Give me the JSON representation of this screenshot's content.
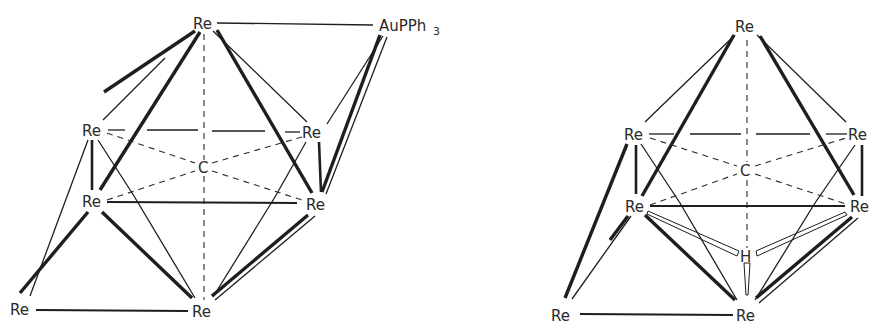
{
  "figure": {
    "left_cluster": {
      "description": "Re8C octahedral cluster with AuPPh3 cap",
      "atoms": [
        {
          "id": "re_top",
          "label": "Re",
          "x": 204,
          "y": 27
        },
        {
          "id": "au",
          "label": "AuPPh",
          "subscript": "3",
          "x": 383,
          "y": 27
        },
        {
          "id": "re_ul",
          "label": "Re",
          "x": 97,
          "y": 133
        },
        {
          "id": "re_ur",
          "label": "Re",
          "x": 313,
          "y": 135
        },
        {
          "id": "c",
          "label": "C",
          "x": 203,
          "y": 168
        },
        {
          "id": "re_ml",
          "label": "Re",
          "x": 93,
          "y": 203
        },
        {
          "id": "re_mr",
          "label": "Re",
          "x": 315,
          "y": 206
        },
        {
          "id": "re_bl",
          "label": "Re",
          "x": 20,
          "y": 311
        },
        {
          "id": "re_b",
          "label": "Re",
          "x": 203,
          "y": 313
        }
      ]
    },
    "right_cluster": {
      "description": "Re8C octahedral cluster with bridging H",
      "atoms": [
        {
          "id": "re_top",
          "label": "Re",
          "x": 746,
          "y": 29
        },
        {
          "id": "re_ul",
          "label": "Re",
          "x": 636,
          "y": 137
        },
        {
          "id": "re_ur",
          "label": "Re",
          "x": 860,
          "y": 137
        },
        {
          "id": "c",
          "label": "C",
          "x": 745,
          "y": 171
        },
        {
          "id": "h",
          "label": "H",
          "x": 746,
          "y": 258
        },
        {
          "id": "re_ml",
          "label": "Re",
          "x": 637,
          "y": 209
        },
        {
          "id": "re_mr",
          "label": "Re",
          "x": 860,
          "y": 209
        },
        {
          "id": "re_bl",
          "label": "Re",
          "x": 562,
          "y": 318
        },
        {
          "id": "re_b",
          "label": "Re",
          "x": 746,
          "y": 318
        }
      ]
    }
  }
}
